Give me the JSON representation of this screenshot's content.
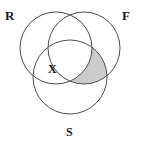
{
  "figure": {
    "type": "venn-diagram-3-set",
    "title": "",
    "background_color": "#ffffff",
    "stroke_color": "#4d4d4d",
    "stroke_width": 1,
    "shade_fill_color": "#cccccc",
    "label_color": "#1a1a1a"
  },
  "sets": [
    {
      "id": "R",
      "label": "R",
      "label_position": "top-left",
      "center": {
        "x": 56,
        "y": 48
      },
      "radius": 36
    },
    {
      "id": "F",
      "label": "F",
      "label_position": "top-right",
      "center": {
        "x": 84,
        "y": 48
      },
      "radius": 36
    },
    {
      "id": "S",
      "label": "S",
      "label_position": "bottom-center",
      "center": {
        "x": 70,
        "y": 77
      },
      "radius": 37
    }
  ],
  "region_labels": [
    {
      "id": "X",
      "label": "X",
      "description": "R and S only, outside F",
      "position": {
        "x": 52,
        "y": 69
      }
    }
  ],
  "shaded_regions": [
    {
      "id": "F-and-S-not-R",
      "description": "Intersection of F and S, excluding R",
      "fill": "#cccccc"
    }
  ]
}
